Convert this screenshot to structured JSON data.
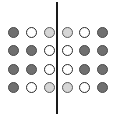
{
  "diagram": {
    "type": "dot-grid-symmetry",
    "rows": 4,
    "cols": 6,
    "colors": {
      "dark": "#707070",
      "light": "#d6d6d6",
      "white": "#ffffff",
      "line": "#1a1a1a"
    },
    "col_centers_x": [
      13,
      31,
      49,
      67,
      84,
      102
    ],
    "row_centers_y": [
      32,
      50,
      69,
      87
    ],
    "grid": [
      [
        "dark",
        "white",
        "light",
        "light",
        "white",
        "dark"
      ],
      [
        "dark",
        "dark",
        "white",
        "white",
        "dark",
        "dark"
      ],
      [
        "dark",
        "dark",
        "white",
        "white",
        "dark",
        "dark"
      ],
      [
        "dark",
        "white",
        "light",
        "light",
        "white",
        "dark"
      ]
    ],
    "mirror_line": {
      "orientation": "vertical",
      "x": 57,
      "y_start": 2,
      "y_end": 114
    }
  }
}
